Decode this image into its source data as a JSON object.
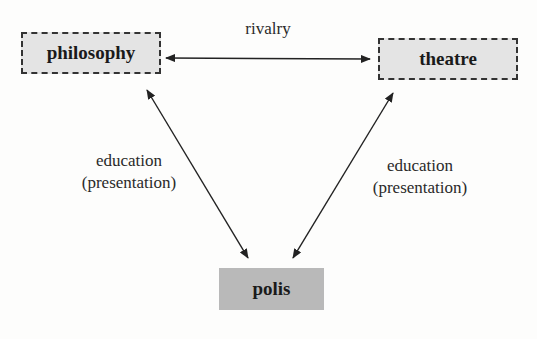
{
  "nodes": {
    "philosophy": {
      "label": "philosophy",
      "style": "dashed"
    },
    "theatre": {
      "label": "theatre",
      "style": "dashed"
    },
    "polis": {
      "label": "polis",
      "style": "solid-gray"
    }
  },
  "edges": {
    "top": {
      "label": "rivalry",
      "from": "philosophy",
      "to": "theatre",
      "direction": "bidirectional"
    },
    "left": {
      "line1": "education",
      "line2": "(presentation)",
      "from": "philosophy",
      "to": "polis",
      "direction": "bidirectional"
    },
    "right": {
      "line1": "education",
      "line2": "(presentation)",
      "from": "theatre",
      "to": "polis",
      "direction": "bidirectional"
    }
  },
  "colors": {
    "dashed_fill": "#e4e4e4",
    "polis_fill": "#b9b9b9",
    "line": "#222222"
  }
}
